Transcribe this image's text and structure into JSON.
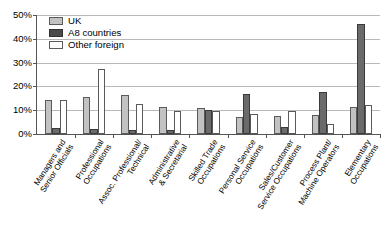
{
  "chart_data": {
    "type": "bar",
    "title": "",
    "xlabel": "",
    "ylabel": "",
    "ylim": [
      0,
      50
    ],
    "ytick_values": [
      0,
      10,
      20,
      30,
      40,
      50
    ],
    "ytick_labels": [
      "0%",
      "10%",
      "20%",
      "30%",
      "40%",
      "50%"
    ],
    "grid": true,
    "legend_position": "top-left",
    "categories": [
      "Managers and Senior Officials",
      "Professional Occupations",
      "Assoc. Professional/ Technical",
      "Administrative & Secretarial",
      "Skilled Trade Occupations",
      "Personal Service Occupations",
      "Sales/Customer Service Occupations",
      "Process Plant/ Machine Operators",
      "Elementary Occupations"
    ],
    "category_lines": [
      [
        "Managers and",
        "Senior Officials"
      ],
      [
        "Professional",
        "Occupations"
      ],
      [
        "Assoc. Professional/",
        "Technical"
      ],
      [
        "Administrative",
        "& Secretarial"
      ],
      [
        "Skilled Trade",
        "Occupations"
      ],
      [
        "Personal Service",
        "Occupations"
      ],
      [
        "Sales/Customer",
        "Service Occupations"
      ],
      [
        "Process Plant/",
        "Machine Operators"
      ],
      [
        "Elementary",
        "Occupations"
      ]
    ],
    "series": [
      {
        "name": "UK",
        "color": "#c2c2c2",
        "values": [
          14.3,
          15.4,
          16.6,
          11.3,
          11.0,
          7.3,
          7.6,
          7.8,
          11.3
        ]
      },
      {
        "name": "A8 countries",
        "color": "#6a6a6a",
        "values": [
          2.6,
          2.3,
          1.5,
          1.8,
          10.3,
          16.8,
          3.0,
          17.6,
          46.2
        ]
      },
      {
        "name": "Other foreign",
        "color": "#ffffff",
        "values": [
          14.2,
          27.4,
          12.5,
          9.8,
          9.8,
          8.3,
          9.6,
          4.0,
          12.2
        ]
      }
    ]
  },
  "legend": {
    "items": [
      {
        "label": "UK",
        "key": "uk"
      },
      {
        "label": "A8 countries",
        "key": "a8"
      },
      {
        "label": "Other foreign",
        "key": "other"
      }
    ]
  },
  "source_note": ""
}
